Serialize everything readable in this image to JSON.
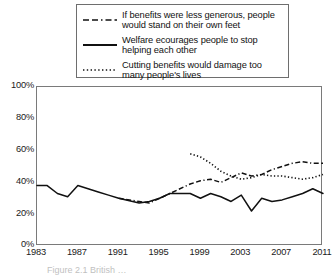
{
  "legend": {
    "position": "top-center-boxed",
    "entries": [
      {
        "style": "dash-dot",
        "icon": "dash-dot-line-icon",
        "label": "If benefits were less generous, people\nwould stand on their own feet"
      },
      {
        "style": "solid",
        "icon": "solid-line-icon",
        "label": "Welfare ecourages people to stop\nhelping each other"
      },
      {
        "style": "dotted",
        "icon": "dotted-line-icon",
        "label": "Cutting benefits would damage too\nmany people's lives"
      }
    ]
  },
  "axes": {
    "y_ticks": [
      "100%",
      "80%",
      "60%",
      "40%",
      "20%",
      "0%"
    ],
    "x_ticks": [
      "1983",
      "1987",
      "1991",
      "1995",
      "1999",
      "2003",
      "2007",
      "2011"
    ]
  },
  "caption": "Figure 2.1  British …",
  "colors": {
    "line": "#111111",
    "frame": "#7a7a7a",
    "background": "#ffffff"
  },
  "chart_data": {
    "type": "line",
    "title": "",
    "xlabel": "",
    "ylabel": "",
    "xlim": [
      1983,
      2011
    ],
    "ylim": [
      0,
      100
    ],
    "y_tick_values": [
      0,
      20,
      40,
      60,
      80,
      100
    ],
    "x_tick_values": [
      1983,
      1987,
      1991,
      1995,
      1999,
      2003,
      2007,
      2011
    ],
    "grid": false,
    "legend_position": "above-plot",
    "units": "percent",
    "series": [
      {
        "name": "If benefits were less generous, people would stand on their own feet",
        "style": "dash-dot",
        "x": [
          1991,
          1993,
          1994,
          1995,
          1996,
          1998,
          1999,
          2000,
          2001,
          2002,
          2003,
          2004,
          2005,
          2006,
          2007,
          2008,
          2009,
          2010,
          2011
        ],
        "values": [
          30,
          28,
          27,
          30,
          33,
          39,
          41,
          42,
          40,
          43,
          46,
          44,
          45,
          48,
          50,
          52,
          53,
          52,
          52
        ]
      },
      {
        "name": "Welfare ecourages people to stop helping each other",
        "style": "solid",
        "x": [
          1983,
          1984,
          1985,
          1986,
          1987,
          1989,
          1990,
          1991,
          1993,
          1994,
          1995,
          1996,
          1998,
          1999,
          2000,
          2001,
          2002,
          2003,
          2004,
          2005,
          2006,
          2007,
          2008,
          2009,
          2010,
          2011
        ],
        "values": [
          38,
          38,
          33,
          31,
          38,
          34,
          32,
          30,
          27,
          28,
          30,
          33,
          33,
          30,
          33,
          31,
          28,
          32,
          22,
          30,
          28,
          29,
          31,
          33,
          36,
          33
        ]
      },
      {
        "name": "Cutting benefits would damage too many people's lives",
        "style": "dotted",
        "x": [
          1998,
          1999,
          2000,
          2001,
          2002,
          2003,
          2004,
          2005,
          2006,
          2007,
          2008,
          2009,
          2010,
          2011
        ],
        "values": [
          58,
          56,
          52,
          47,
          44,
          42,
          43,
          45,
          44,
          44,
          43,
          42,
          43,
          45
        ]
      }
    ]
  }
}
